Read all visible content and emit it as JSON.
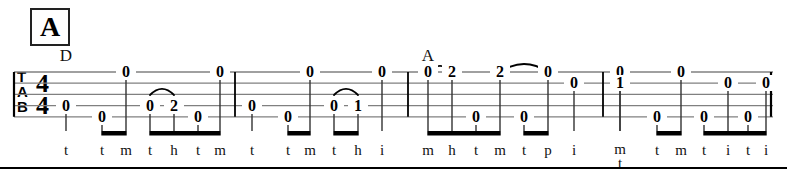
{
  "section": {
    "label": "A"
  },
  "chords": [
    {
      "name": "D",
      "x": 66,
      "y": 46
    },
    {
      "name": "A",
      "x": 428,
      "y": 46
    }
  ],
  "clef": {
    "lines": [
      "T",
      "A",
      "B"
    ]
  },
  "time_signature": {
    "top": "4",
    "bottom": "4"
  },
  "staff": {
    "lines": 5,
    "top_y": 72,
    "spacing": 11.2,
    "left": 14,
    "right": 773
  },
  "barlines": [
    14,
    235,
    408,
    603,
    771
  ],
  "notation": {
    "slur_symbol": "tie-arc",
    "beam_symbol": "eighth-beam"
  },
  "measures": [
    {
      "index": 1,
      "notes": [
        {
          "fret": "0",
          "string": 4,
          "x": 66,
          "fing": "t"
        },
        {
          "fret": "0",
          "string": 5,
          "x": 102,
          "fing": "t"
        },
        {
          "fret": "0",
          "string": 1,
          "x": 126,
          "fing": "m"
        },
        {
          "fret": "0",
          "string": 4,
          "x": 150,
          "fing": "t"
        },
        {
          "fret": "2",
          "string": 4,
          "x": 174,
          "fing": "h"
        },
        {
          "fret": "0",
          "string": 5,
          "x": 198,
          "fing": "t"
        },
        {
          "fret": "0",
          "string": 1,
          "x": 220,
          "fing": "m"
        }
      ],
      "slurs": [
        {
          "from_x": 150,
          "to_x": 174,
          "y": 95
        }
      ],
      "beams": [
        {
          "from_x": 102,
          "to_x": 126
        },
        {
          "from_x": 150,
          "to_x": 220
        }
      ]
    },
    {
      "index": 2,
      "notes": [
        {
          "fret": "0",
          "string": 4,
          "x": 252,
          "fing": "t"
        },
        {
          "fret": "0",
          "string": 5,
          "x": 288,
          "fing": "t"
        },
        {
          "fret": "0",
          "string": 1,
          "x": 310,
          "fing": "m"
        },
        {
          "fret": "0",
          "string": 4,
          "x": 334,
          "fing": "t"
        },
        {
          "fret": "1",
          "string": 4,
          "x": 358,
          "fing": "h"
        },
        {
          "fret": "0",
          "string": 1,
          "x": 382,
          "fing": "i"
        }
      ],
      "slurs": [
        {
          "from_x": 334,
          "to_x": 358,
          "y": 95
        }
      ],
      "beams": [
        {
          "from_x": 288,
          "to_x": 310
        },
        {
          "from_x": 334,
          "to_x": 358
        }
      ]
    },
    {
      "index": 3,
      "notes": [
        {
          "fret": "0",
          "string": 1,
          "x": 428,
          "fing": "m"
        },
        {
          "fret": "2",
          "string": 1,
          "x": 452,
          "fing": "h"
        },
        {
          "fret": "0",
          "string": 5,
          "x": 476,
          "fing": "t"
        },
        {
          "fret": "2",
          "string": 1,
          "x": 500,
          "fing": "m"
        },
        {
          "fret": "0",
          "string": 5,
          "x": 524,
          "fing": "t"
        },
        {
          "fret": "0",
          "string": 1,
          "x": 548,
          "fing": "p"
        },
        {
          "fret": "0",
          "string": 2,
          "x": 574,
          "fing": "i"
        }
      ],
      "slurs": [
        {
          "from_x": 428,
          "to_x": 452,
          "y": 72
        },
        {
          "from_x": 500,
          "to_x": 548,
          "y": 72
        }
      ],
      "beams": [
        {
          "from_x": 428,
          "to_x": 500
        },
        {
          "from_x": 524,
          "to_x": 548
        }
      ]
    },
    {
      "index": 4,
      "notes": [
        {
          "fret": "0",
          "string": 1,
          "x": 620,
          "fing": "m",
          "fing2": "t"
        },
        {
          "fret": "1",
          "string": 2,
          "x": 620,
          "fing": ""
        },
        {
          "fret": "0",
          "string": 5,
          "x": 657,
          "fing": "t"
        },
        {
          "fret": "0",
          "string": 1,
          "x": 681,
          "fing": "m"
        },
        {
          "fret": "0",
          "string": 5,
          "x": 704,
          "fing": "t"
        },
        {
          "fret": "0",
          "string": 2,
          "x": 728,
          "fing": "i"
        },
        {
          "fret": "0",
          "string": 5,
          "x": 748,
          "fing": "t"
        },
        {
          "fret": "0",
          "string": 2,
          "x": 766,
          "fing": "i"
        }
      ],
      "slurs": [],
      "beams": [
        {
          "from_x": 657,
          "to_x": 681
        },
        {
          "from_x": 704,
          "to_x": 766
        }
      ]
    }
  ]
}
